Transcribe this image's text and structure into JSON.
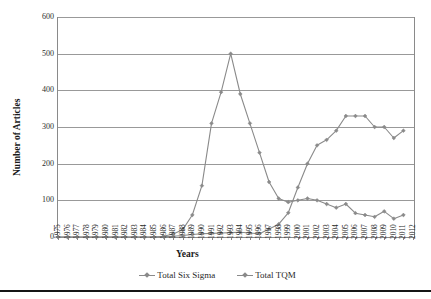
{
  "chart_data": {
    "type": "line",
    "title": "",
    "xlabel": "Years",
    "ylabel": "Number of Articles",
    "grid": true,
    "legend_position": "bottom",
    "xlim": [
      1975,
      2012
    ],
    "ylim": [
      0,
      600
    ],
    "yticks": [
      0,
      100,
      200,
      300,
      400,
      500,
      600
    ],
    "categories": [
      "1975",
      "1976",
      "1977",
      "1978",
      "1979",
      "1980",
      "1981",
      "1982",
      "1983",
      "1984",
      "1985",
      "1986",
      "1987",
      "1988",
      "1989",
      "1990",
      "1991",
      "1992",
      "1993",
      "1994",
      "1995",
      "1996",
      "1997",
      "1998",
      "1999",
      "2000",
      "2001",
      "2002",
      "2003",
      "2004",
      "2005",
      "2006",
      "2007",
      "2008",
      "2009",
      "2010",
      "2011",
      "2012"
    ],
    "series": [
      {
        "name": "Total Six Sigma",
        "color": "#8a8a8a",
        "marker": "diamond",
        "values": [
          0,
          0,
          0,
          0,
          0,
          0,
          0,
          0,
          0,
          0,
          0,
          1,
          2,
          4,
          7,
          9,
          10,
          11,
          12,
          13,
          11,
          9,
          22,
          35,
          66,
          135,
          200,
          250,
          265,
          290,
          330,
          330,
          330,
          300,
          300,
          270,
          290,
          null
        ]
      },
      {
        "name": "Total TQM",
        "color": "#8a8a8a",
        "marker": "diamond",
        "values": [
          0,
          0,
          0,
          0,
          0,
          0,
          0,
          0,
          0,
          0,
          0,
          2,
          8,
          20,
          60,
          140,
          310,
          395,
          500,
          390,
          310,
          230,
          150,
          105,
          95,
          100,
          105,
          100,
          90,
          80,
          90,
          65,
          60,
          55,
          70,
          50,
          60,
          null
        ]
      }
    ]
  },
  "legend": {
    "entries": [
      {
        "label": "Total Six Sigma",
        "color": "#8a8a8a"
      },
      {
        "label": "Total TQM",
        "color": "#8a8a8a"
      }
    ]
  },
  "axes": {
    "y_title": "Number of Articles",
    "x_title": "Years",
    "y_tick_labels": [
      "600",
      "500",
      "400",
      "300",
      "200",
      "100",
      "0"
    ]
  }
}
